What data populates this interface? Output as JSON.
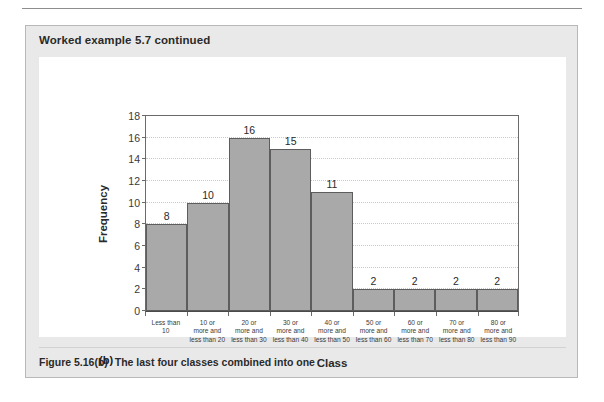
{
  "page": {
    "header_title": "Worked example 5.7 continued",
    "panel_tag": "(b)",
    "caption_number": "Figure 5.16(b)",
    "caption_text": "The last four classes combined into one"
  },
  "colors": {
    "bar_fill": "#a9a9a9",
    "bar_stroke": "#5d5d5d",
    "header_band": "#e9e9e9",
    "panel_border": "#b8b8b8",
    "gridline": "#c9c9c9",
    "axis": "#6a6a6a",
    "text": "#2a2a2a"
  },
  "chart_data": {
    "type": "bar",
    "title": "",
    "xlabel": "Class",
    "ylabel": "Frequency",
    "ylim": [
      0,
      18
    ],
    "yticks": [
      0,
      2,
      4,
      6,
      8,
      10,
      12,
      14,
      16,
      18
    ],
    "grid": true,
    "legend": "none",
    "categories": [
      "Less than 10",
      "10 or more and less than 20",
      "20 or more and less than 30",
      "30 or more and less than 40",
      "40 or more and less than 50",
      "50 or more and less than 60",
      "60 or more and less than 70",
      "70 or more and less than 80",
      "80 or more and less than 90"
    ],
    "category_lines": [
      [
        "Less than",
        "10"
      ],
      [
        "10 or",
        "more and",
        "less than 20"
      ],
      [
        "20 or",
        "more and",
        "less than 30"
      ],
      [
        "30 or",
        "more and",
        "less than 40"
      ],
      [
        "40 or",
        "more and",
        "less than 50"
      ],
      [
        "50 or",
        "more and",
        "less than 60"
      ],
      [
        "60 or",
        "more and",
        "less than 70"
      ],
      [
        "70 or",
        "more and",
        "less than 80"
      ],
      [
        "80 or",
        "more and",
        "less than 90"
      ]
    ],
    "values": [
      8,
      10,
      16,
      15,
      11,
      2,
      2,
      2,
      2
    ]
  }
}
